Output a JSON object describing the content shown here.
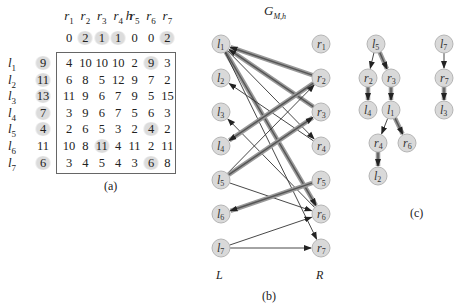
{
  "panel_a": {
    "caption": "(a)",
    "h_label": "h",
    "col_headers": [
      "r1",
      "r2",
      "r3",
      "r4",
      "r5",
      "r6",
      "r7"
    ],
    "h_row": [
      0,
      2,
      1,
      1,
      0,
      0,
      2
    ],
    "h_row_highlight": [
      false,
      true,
      true,
      true,
      false,
      false,
      true
    ],
    "rows": [
      {
        "label": "l1",
        "h": 9,
        "h_hl": true,
        "values": [
          4,
          10,
          10,
          10,
          2,
          9,
          3
        ],
        "hl": [
          false,
          false,
          false,
          false,
          false,
          true,
          false
        ]
      },
      {
        "label": "l2",
        "h": 11,
        "h_hl": true,
        "values": [
          6,
          8,
          5,
          12,
          9,
          7,
          2
        ],
        "hl": [
          false,
          false,
          false,
          false,
          false,
          false,
          false
        ]
      },
      {
        "label": "l3",
        "h": 13,
        "h_hl": true,
        "values": [
          11,
          9,
          6,
          7,
          9,
          5,
          15
        ],
        "hl": [
          false,
          false,
          false,
          false,
          false,
          false,
          false
        ]
      },
      {
        "label": "l4",
        "h": 7,
        "h_hl": true,
        "values": [
          3,
          9,
          6,
          7,
          5,
          6,
          3
        ],
        "hl": [
          false,
          false,
          false,
          false,
          false,
          false,
          false
        ]
      },
      {
        "label": "l5",
        "h": 4,
        "h_hl": true,
        "values": [
          2,
          6,
          5,
          3,
          2,
          4,
          2
        ],
        "hl": [
          false,
          false,
          false,
          false,
          false,
          true,
          false
        ]
      },
      {
        "label": "l6",
        "h": 11,
        "h_hl": false,
        "values": [
          10,
          8,
          11,
          4,
          11,
          2,
          11
        ],
        "hl": [
          false,
          false,
          true,
          false,
          false,
          false,
          false
        ]
      },
      {
        "label": "l7",
        "h": 6,
        "h_hl": true,
        "values": [
          3,
          4,
          5,
          4,
          3,
          6,
          8
        ],
        "hl": [
          false,
          false,
          false,
          false,
          false,
          true,
          false
        ]
      }
    ]
  },
  "panel_b": {
    "caption": "(b)",
    "title": "G",
    "title_sub": "M,h",
    "left_label": "L",
    "right_label": "R",
    "left_nodes": [
      "l1",
      "l2",
      "l3",
      "l4",
      "l5",
      "l6",
      "l7"
    ],
    "right_nodes": [
      "r1",
      "r2",
      "r3",
      "r4",
      "r5",
      "r6",
      "r7"
    ],
    "edges": [
      {
        "from": "r3",
        "to": "l1",
        "matched": true
      },
      {
        "from": "r2",
        "to": "l1",
        "matched": true
      },
      {
        "from": "l1",
        "to": "r4",
        "matched": false
      },
      {
        "from": "l1",
        "to": "r6",
        "matched": true
      },
      {
        "from": "l1",
        "to": "r7",
        "matched": false
      },
      {
        "from": "r4",
        "to": "l2",
        "matched": false
      },
      {
        "from": "r6",
        "to": "l3",
        "matched": false
      },
      {
        "from": "r2",
        "to": "l4",
        "matched": true
      },
      {
        "from": "l5",
        "to": "r2",
        "matched": false
      },
      {
        "from": "l5",
        "to": "r3",
        "matched": true
      },
      {
        "from": "l5",
        "to": "r6",
        "matched": false
      },
      {
        "from": "r5",
        "to": "l6",
        "matched": true
      },
      {
        "from": "l7",
        "to": "r6",
        "matched": false
      },
      {
        "from": "l7",
        "to": "r7",
        "matched": false
      }
    ]
  },
  "panel_c": {
    "caption": "(c)",
    "nodes": [
      "l5",
      "r2",
      "r3",
      "l4",
      "l1",
      "r4",
      "r6",
      "l2",
      "l7",
      "r7",
      "l3"
    ],
    "edges": [
      {
        "from": "l5",
        "to": "r2",
        "matched": false
      },
      {
        "from": "l5",
        "to": "r3",
        "matched": true
      },
      {
        "from": "r2",
        "to": "l4",
        "matched": true
      },
      {
        "from": "r3",
        "to": "l1",
        "matched": true
      },
      {
        "from": "l1",
        "to": "r4",
        "matched": false
      },
      {
        "from": "l1",
        "to": "r6",
        "matched": true
      },
      {
        "from": "r4",
        "to": "l2",
        "matched": true
      },
      {
        "from": "l7",
        "to": "r7",
        "matched": false
      },
      {
        "from": "r7",
        "to": "l3",
        "matched": true
      }
    ]
  }
}
